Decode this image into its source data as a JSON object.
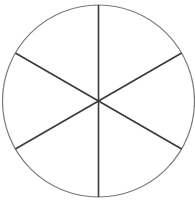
{
  "diagram": {
    "type": "circle-divided-into-sectors",
    "sectors": 6,
    "center": {
      "x": 98.5,
      "y": 101
    },
    "radius": 96,
    "spoke_angles_deg": [
      90,
      30,
      -30,
      -90,
      -150,
      150
    ],
    "colors": {
      "background": "#ffffff",
      "circle_stroke": "#7a7a7a",
      "spoke_stroke": "#3a3a3a"
    },
    "stroke_widths": {
      "circle": 1.2,
      "spoke": 1.6
    }
  }
}
